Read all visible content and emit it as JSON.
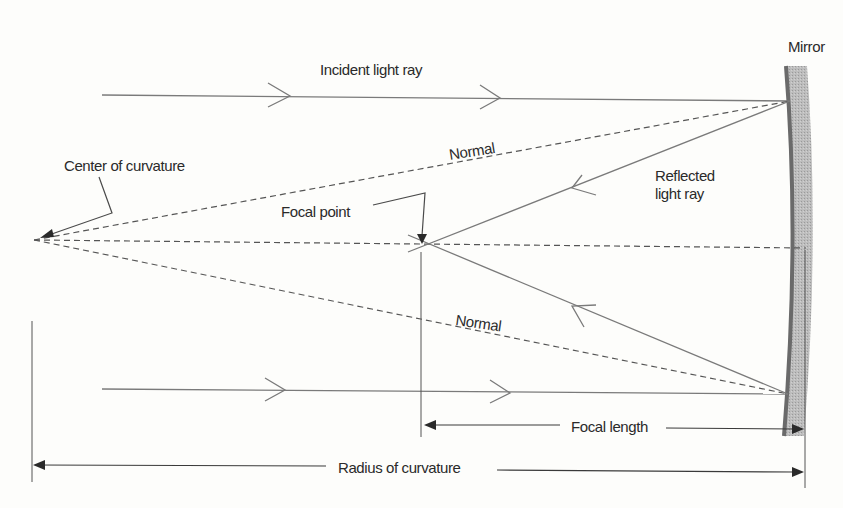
{
  "diagram": {
    "labels": {
      "mirror": "Mirror",
      "incident_ray": "Incident light ray",
      "normal_upper": "Normal",
      "normal_lower": "Normal",
      "reflected_ray_line1": "Reflected",
      "reflected_ray_line2": "light ray",
      "center_of_curvature": "Center of curvature",
      "focal_point": "Focal point",
      "focal_length": "Focal length",
      "radius_of_curvature": "Radius of curvature"
    },
    "colors": {
      "mirror_fill": "#b8b8b8",
      "mirror_surface": "#707070",
      "ray": "#7a7a7a",
      "normal": "#555555",
      "text": "#2a2a2a",
      "background": "#fdfdfb"
    }
  }
}
